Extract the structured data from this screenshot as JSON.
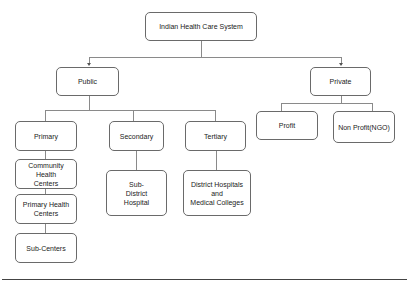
{
  "diagram": {
    "root": {
      "label": "Indian Health Care System"
    },
    "public": {
      "label": "Public",
      "children": {
        "primary": {
          "label": "Primary",
          "items": [
            "Community\nHealth\nCenters",
            "Primary Health\nCenters",
            "Sub-Centers"
          ]
        },
        "secondary": {
          "label": "Secondary",
          "items": [
            "Sub-\nDistrict\nHospital"
          ]
        },
        "tertiary": {
          "label": "Tertiary",
          "items": [
            "District Hospitals\nand\nMedical Colleges"
          ]
        }
      }
    },
    "private": {
      "label": "Private",
      "children": {
        "profit": {
          "label": "Profit"
        },
        "nonprofit": {
          "label": "Non Profit(NGO)"
        }
      }
    },
    "colors": {
      "border": "#6a6a6a",
      "connector": "#8a8a8a",
      "background": "#ffffff"
    }
  }
}
